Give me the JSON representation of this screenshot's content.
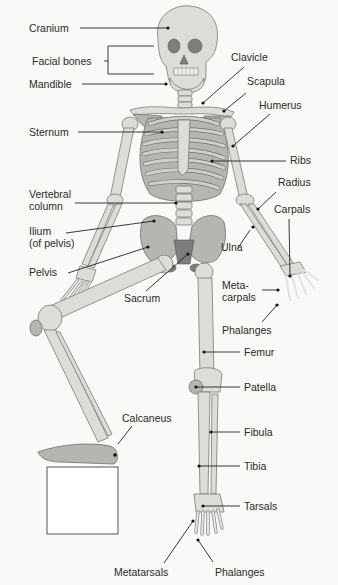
{
  "colors": {
    "background": "#f9f9f8",
    "bone": "#dcdcd8",
    "bone_shade": "#a9a9a5",
    "bone_dark": "#6e6e6c",
    "leader_line": "#222222",
    "text": "#2a2a2a",
    "block": "#ffffff"
  },
  "labels": {
    "cranium": "Cranium",
    "facial_bones": "Facial bones",
    "mandible": "Mandible",
    "clavicle": "Clavicle",
    "scapula": "Scapula",
    "humerus": "Humerus",
    "sternum": "Sternum",
    "ribs": "Ribs",
    "radius": "Radius",
    "vertebral_column": "Vertebral\ncolumn",
    "carpals": "Carpals",
    "ilium": "Ilium\n(of pelvis)",
    "ulna": "Ulna",
    "pelvis": "Pelvis",
    "sacrum": "Sacrum",
    "metacarpals": "Meta-\ncarpals",
    "phalanges_hand": "Phalanges",
    "femur": "Femur",
    "patella": "Patella",
    "calcaneus": "Calcaneus",
    "fibula": "Fibula",
    "tibia": "Tibia",
    "tarsals": "Tarsals",
    "metatarsals": "Metatarsals",
    "phalanges_foot": "Phalanges"
  }
}
